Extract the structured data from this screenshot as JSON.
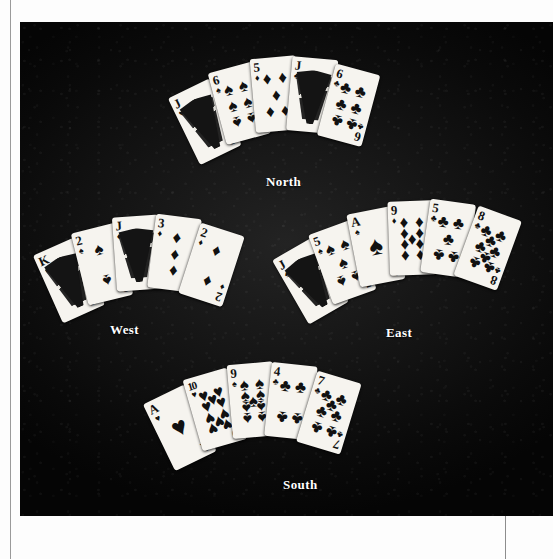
{
  "plate": {
    "background_color": "#0c0c0c",
    "page_color": "#ffffff",
    "label_color": "#ffffff"
  },
  "suits": {
    "spade": "♠",
    "heart": "♥",
    "diamond": "♦",
    "club": "♣"
  },
  "hands": [
    {
      "id": "north",
      "label": "North",
      "cards": [
        {
          "rank": "J",
          "suit": "♥",
          "suit_name": "heart",
          "face": "court"
        },
        {
          "rank": "6",
          "suit": "♠",
          "suit_name": "spade",
          "face": "pips",
          "count": 6
        },
        {
          "rank": "5",
          "suit": "♦",
          "suit_name": "diamond",
          "face": "pips",
          "count": 5
        },
        {
          "rank": "J",
          "suit": "♣",
          "suit_name": "club",
          "face": "court"
        },
        {
          "rank": "6",
          "suit": "♣",
          "suit_name": "club",
          "face": "pips",
          "count": 6
        }
      ]
    },
    {
      "id": "west",
      "label": "West",
      "cards": [
        {
          "rank": "K",
          "suit": "♠",
          "suit_name": "spade",
          "face": "court"
        },
        {
          "rank": "2",
          "suit": "♠",
          "suit_name": "spade",
          "face": "pips",
          "count": 2
        },
        {
          "rank": "J",
          "suit": "♦",
          "suit_name": "diamond",
          "face": "court"
        },
        {
          "rank": "3",
          "suit": "♦",
          "suit_name": "diamond",
          "face": "pips",
          "count": 3
        },
        {
          "rank": "2",
          "suit": "♦",
          "suit_name": "diamond",
          "face": "pips",
          "count": 2
        }
      ]
    },
    {
      "id": "east",
      "label": "East",
      "cards": [
        {
          "rank": "J",
          "suit": "♠",
          "suit_name": "spade",
          "face": "court"
        },
        {
          "rank": "5",
          "suit": "♠",
          "suit_name": "spade",
          "face": "pips",
          "count": 5
        },
        {
          "rank": "A",
          "suit": "♠",
          "suit_name": "spade",
          "face": "ace"
        },
        {
          "rank": "9",
          "suit": "♦",
          "suit_name": "diamond",
          "face": "pips",
          "count": 9
        },
        {
          "rank": "5",
          "suit": "♣",
          "suit_name": "club",
          "face": "pips",
          "count": 5
        },
        {
          "rank": "8",
          "suit": "♣",
          "suit_name": "club",
          "face": "pips",
          "count": 8
        }
      ]
    },
    {
      "id": "south",
      "label": "South",
      "cards": [
        {
          "rank": "A",
          "suit": "♥",
          "suit_name": "heart",
          "face": "ace"
        },
        {
          "rank": "10",
          "suit": "♥",
          "suit_name": "heart",
          "face": "pips",
          "count": 10
        },
        {
          "rank": "9",
          "suit": "♠",
          "suit_name": "spade",
          "face": "pips",
          "count": 9
        },
        {
          "rank": "4",
          "suit": "♣",
          "suit_name": "club",
          "face": "pips",
          "count": 4
        },
        {
          "rank": "7",
          "suit": "♣",
          "suit_name": "club",
          "face": "pips",
          "count": 7
        }
      ]
    }
  ]
}
